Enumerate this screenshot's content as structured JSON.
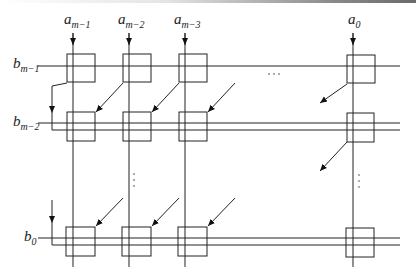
{
  "diagram": {
    "type": "systolic-array-multiplier",
    "inputs_top": [
      {
        "id": "a_m-1",
        "base": "a",
        "sub": "m−1",
        "x": 73
      },
      {
        "id": "a_m-2",
        "base": "a",
        "sub": "m−2",
        "x": 129
      },
      {
        "id": "a_m-3",
        "base": "a",
        "sub": "m−3",
        "x": 185
      },
      {
        "id": "a_0",
        "base": "a",
        "sub": "0",
        "x": 353
      }
    ],
    "inputs_left": [
      {
        "id": "b_m-1",
        "base": "b",
        "sub": "m−1",
        "y": 66
      },
      {
        "id": "b_m-2",
        "base": "b",
        "sub": "m−2",
        "y": 123
      },
      {
        "id": "b_0",
        "base": "b",
        "sub": "0",
        "y": 238
      }
    ],
    "rows": 3,
    "columns": 4,
    "ellipsis_horizontal": "· · ·",
    "ellipsis_vertical": "⋮",
    "colors": {
      "stroke": "#222222",
      "background": "#ffffff"
    }
  }
}
